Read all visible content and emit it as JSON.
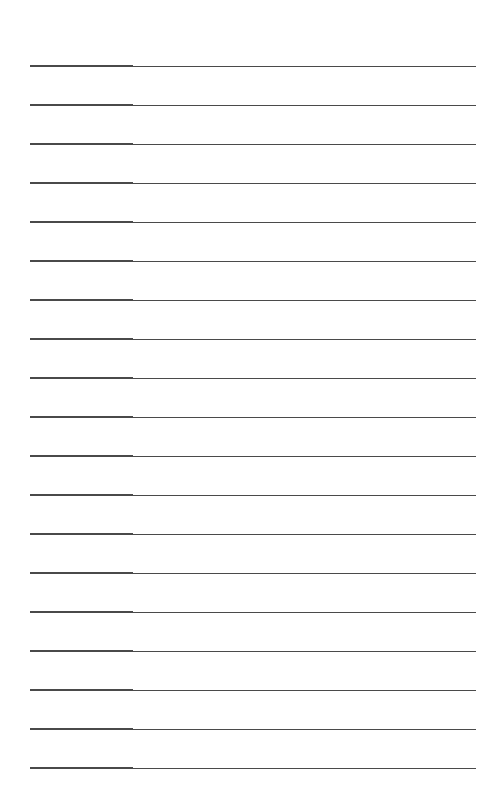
{
  "page": {
    "type": "lined-paper",
    "background_color": "#ffffff",
    "line_color": "#4a4a4a",
    "line_count": 19,
    "lines": [
      {
        "y": 65
      },
      {
        "y": 104
      },
      {
        "y": 143
      },
      {
        "y": 182
      },
      {
        "y": 221
      },
      {
        "y": 260
      },
      {
        "y": 299
      },
      {
        "y": 338
      },
      {
        "y": 377
      },
      {
        "y": 416
      },
      {
        "y": 455
      },
      {
        "y": 494
      },
      {
        "y": 533
      },
      {
        "y": 572
      },
      {
        "y": 611
      },
      {
        "y": 650
      },
      {
        "y": 689
      },
      {
        "y": 728
      },
      {
        "y": 767
      }
    ]
  }
}
